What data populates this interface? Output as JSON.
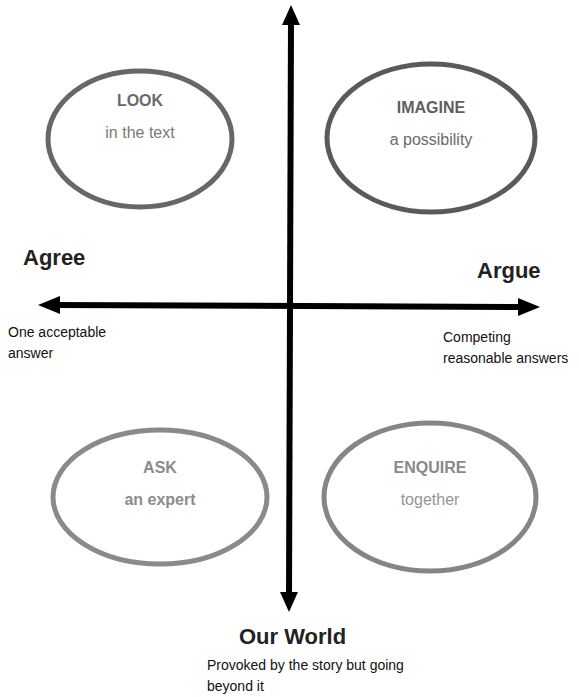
{
  "quadrants": [
    {
      "id": "look",
      "title": "LOOK",
      "subtitle": "in the text",
      "border_color": "#676767",
      "text_color": "#6a6a6a"
    },
    {
      "id": "imagine",
      "title": "IMAGINE",
      "subtitle": "a possibility",
      "border_color": "#5a5a5a",
      "text_color": "#5f5f5f"
    },
    {
      "id": "ask",
      "title": "ASK",
      "subtitle": "an expert",
      "border_color": "#8a8a8a",
      "text_color": "#8c8c8c"
    },
    {
      "id": "enquire",
      "title": "ENQUIRE",
      "subtitle": "together",
      "border_color": "#858585",
      "text_color": "#8a8a8a"
    }
  ],
  "axes": {
    "left": {
      "title": "Agree",
      "description_line1": "One acceptable",
      "description_line2": "answer"
    },
    "right": {
      "title": "Argue",
      "description_line1": "Competing",
      "description_line2": "reasonable answers"
    },
    "bottom": {
      "title": "Our World",
      "description_line1": "Provoked by the story but going",
      "description_line2": "beyond it"
    }
  }
}
